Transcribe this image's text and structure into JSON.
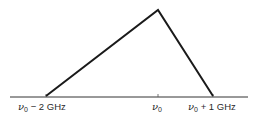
{
  "diagram": {
    "type": "triangular-line-profile",
    "baseline": {
      "x1": 10,
      "x2": 248,
      "y": 97
    },
    "profile": {
      "left_foot": {
        "x": 46,
        "y": 97,
        "label": "ν0 − 2 GHz"
      },
      "peak": {
        "x": 158,
        "y": 10
      },
      "right_foot": {
        "x": 213,
        "y": 97,
        "label": "ν0 + 1 GHz"
      }
    },
    "ticks": [
      {
        "x": 46,
        "label": "ν0 − 2 GHz"
      },
      {
        "x": 158,
        "label": "ν0"
      },
      {
        "x": 213,
        "label": "ν0 + 1 GHz"
      }
    ],
    "labels": {
      "left": {
        "symbol": "ν",
        "subscript": "0",
        "suffix": " − 2 GHz"
      },
      "center": {
        "symbol": "ν",
        "subscript": "0",
        "suffix": ""
      },
      "right": {
        "symbol": "ν",
        "subscript": "0",
        "suffix": " + 1 GHz"
      }
    },
    "colors": {
      "line": "#1a1a1a",
      "axis": "#333333",
      "text": "#2a2a2a"
    }
  }
}
